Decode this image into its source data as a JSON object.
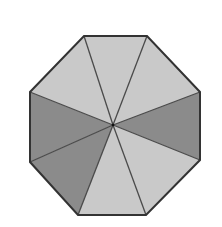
{
  "diagram": {
    "shape": "octagon",
    "center": [
      113,
      125
    ],
    "vertices": [
      [
        84,
        36
      ],
      [
        147,
        36
      ],
      [
        200,
        92
      ],
      [
        200,
        160
      ],
      [
        146,
        215
      ],
      [
        78,
        215
      ],
      [
        30,
        162
      ],
      [
        30,
        92
      ]
    ],
    "sectors": [
      {
        "name": "sector-top",
        "from": 0,
        "to": 1,
        "shade": "light"
      },
      {
        "name": "sector-upper-right",
        "from": 1,
        "to": 2,
        "shade": "light"
      },
      {
        "name": "sector-right",
        "from": 2,
        "to": 3,
        "shade": "dark"
      },
      {
        "name": "sector-lower-right",
        "from": 3,
        "to": 4,
        "shade": "light"
      },
      {
        "name": "sector-bottom",
        "from": 4,
        "to": 5,
        "shade": "light"
      },
      {
        "name": "sector-lower-left",
        "from": 5,
        "to": 6,
        "shade": "dark"
      },
      {
        "name": "sector-left",
        "from": 6,
        "to": 7,
        "shade": "dark"
      },
      {
        "name": "sector-upper-left",
        "from": 7,
        "to": 0,
        "shade": "light"
      }
    ],
    "shaded_count": 3,
    "total_sectors": 8,
    "colors": {
      "light": "#c9c9c9",
      "dark": "#8b8b8b",
      "outline": "#333333",
      "spoke": "#4a4a4a",
      "background": "#ffffff"
    }
  }
}
